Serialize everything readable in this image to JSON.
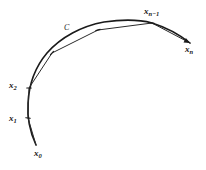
{
  "figure": {
    "background_color": "#ffffff",
    "stroke_color": "#1a1a1a",
    "width": 206,
    "height": 170
  },
  "curve": {
    "name": "C",
    "label": "C",
    "label_x": 64,
    "label_y": 24,
    "path": "M 36,145 C 30,132 27,118 28,103 C 29,84 36,66 47,53 C 61,37 82,26 104,22 C 125,19 141,20 152,23 C 168,28 180,35 190,43",
    "stroke_width": 1.6
  },
  "chords": {
    "name": "inscribed-polygon",
    "stroke_width": 1.0,
    "vertices": [
      {
        "id": "x0",
        "x": 36,
        "y": 145
      },
      {
        "id": "x1",
        "x": 28,
        "y": 118
      },
      {
        "id": "x2",
        "x": 29,
        "y": 88
      },
      {
        "id": "xi",
        "x": 52,
        "y": 53
      },
      {
        "id": "xj",
        "x": 98,
        "y": 30
      },
      {
        "id": "xn_1",
        "x": 152,
        "y": 23
      },
      {
        "id": "xn",
        "x": 190,
        "y": 43
      }
    ]
  },
  "ticks": [
    {
      "name": "tick-x1",
      "x": 28,
      "y": 118,
      "angle": 8
    },
    {
      "name": "tick-x2",
      "x": 29,
      "y": 88,
      "angle": 0
    },
    {
      "name": "tick-xi",
      "x": 52,
      "y": 53,
      "angle": -48
    },
    {
      "name": "tick-xj",
      "x": 98,
      "y": 30,
      "angle": -16
    },
    {
      "name": "tick-xn-1",
      "x": 152,
      "y": 23,
      "angle": 6
    }
  ],
  "labels": [
    {
      "name": "point-label-x0",
      "base": "x",
      "subscript": "0",
      "x": 34,
      "y": 149
    },
    {
      "name": "point-label-x1",
      "base": "x",
      "subscript": "1",
      "x": 9,
      "y": 114
    },
    {
      "name": "point-label-x2",
      "base": "x",
      "subscript": "2",
      "x": 9,
      "y": 81
    },
    {
      "name": "point-label-xn-1",
      "base": "x",
      "subscript": "n−1",
      "x": 144,
      "y": 7
    },
    {
      "name": "point-label-xn",
      "base": "x",
      "subscript": "n",
      "x": 185,
      "y": 45
    }
  ]
}
